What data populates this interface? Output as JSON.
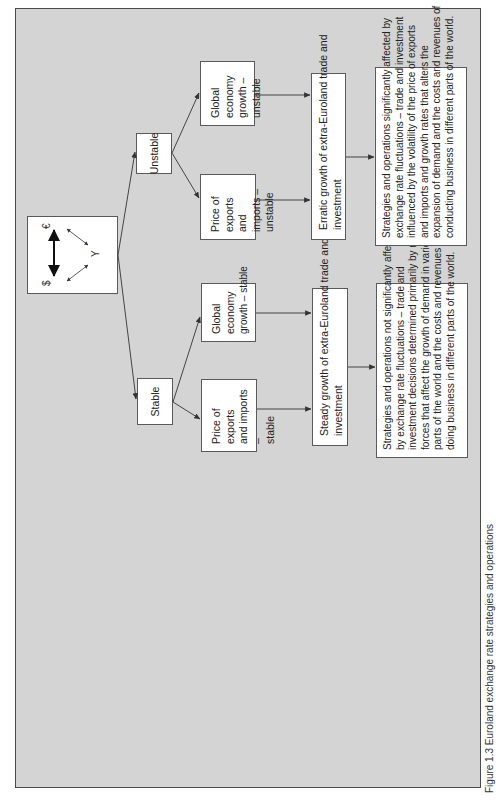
{
  "figure": {
    "caption": "Figure 1.3   Euroland exchange rate strategies and operations",
    "orientation": "rotated 90° (text reads bottom-to-top)",
    "colors": {
      "frame_background": "#d4d4d4",
      "box_background": "#ffffff",
      "border": "#4a4a4a",
      "text": "#222222"
    }
  },
  "currency_box": {
    "dollar": "$",
    "euro": "€",
    "yen": "Y"
  },
  "branches": {
    "stable": {
      "label": "Stable",
      "price": "Price of exports and imports – stable",
      "price_lines": [
        "Price of exports",
        "and imports –",
        "stable"
      ],
      "global": "Global economy growth – stable",
      "global_lines": [
        "Global",
        "economy",
        "growth – stable"
      ],
      "growth_lines": [
        "Steady growth of extra-Euroland trade and",
        "investment"
      ],
      "outcome_lines": [
        "Strategies and operations not significantly affected",
        "by exchange rate fluctuations – trade and",
        "investment decisions determined primarily by real",
        "forces that affect the growth of demand in various",
        "parts of the world and the costs and revenues of",
        "doing business in different parts of the world."
      ]
    },
    "unstable": {
      "label": "Unstable",
      "price_lines": [
        "Price of exports",
        "and imports –",
        "unstable"
      ],
      "global_lines": [
        "Global economy",
        "growth –",
        "unstable"
      ],
      "growth_lines": [
        "Erratic growth of extra-Euroland trade and",
        "investment"
      ],
      "outcome_lines": [
        "Strategies and operations significantly affected by",
        "exchange rate fluctuations – trade and investment",
        "influenced by the volatility of the price of exports",
        "and imports and growth rates that alters the",
        "expansion of demand and the costs and revenues of",
        "conducting business in different parts of the world."
      ]
    }
  }
}
